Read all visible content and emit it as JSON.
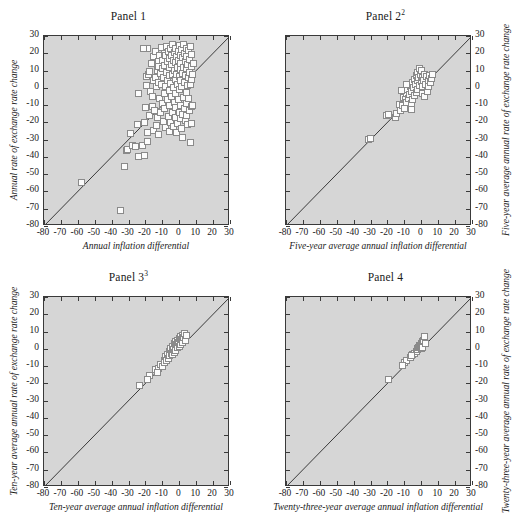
{
  "figure": {
    "background_color": "#ffffff",
    "plot_background_color": "#d6d6d6",
    "axis_color": "#3a3a3a",
    "marker_face_color": "#fcfcfc",
    "marker_edge_color": "#8a8a8a",
    "panel_count": 4
  },
  "chart_data": [
    {
      "type": "scatter",
      "title": "Panel 1",
      "title_superscript": "",
      "xlabel": "Annual inflation differential",
      "ylabel": "Annual rate of exchange rate change",
      "yaxis_side": "left",
      "xlim": [
        -80,
        30
      ],
      "ylim": [
        -80,
        30
      ],
      "xticks": [
        -80,
        -70,
        -60,
        -50,
        -40,
        -30,
        -20,
        -10,
        0,
        10,
        20,
        30
      ],
      "yticks": [
        -80,
        -70,
        -60,
        -50,
        -40,
        -30,
        -20,
        -10,
        0,
        10,
        20,
        30
      ],
      "xtick_labels": [
        "-80",
        "-70",
        "-60",
        "-50",
        "-40",
        "-30",
        "-20",
        "-10",
        "0",
        "10",
        "20",
        "30"
      ],
      "ytick_labels": [
        "-80",
        "-70",
        "-60",
        "-50",
        "-40",
        "-30",
        "-20",
        "-10",
        "0",
        "10",
        "20",
        "30"
      ],
      "grid": false,
      "legend": null,
      "reference_line": {
        "type": "45-degree",
        "from": [
          -80,
          -80
        ],
        "to": [
          30,
          30
        ]
      },
      "points": [
        [
          -58,
          -55
        ],
        [
          -35,
          -71
        ],
        [
          -32.5,
          -45.5
        ],
        [
          -31.5,
          -36.5
        ],
        [
          -30.5,
          -35.5
        ],
        [
          -29,
          -26.5
        ],
        [
          -27.5,
          -33.5
        ],
        [
          -26,
          -34
        ],
        [
          -25,
          -21
        ],
        [
          -24,
          -39.5
        ],
        [
          -21.5,
          -33.5
        ],
        [
          -20.5,
          -39
        ],
        [
          -20.5,
          -20
        ],
        [
          -20,
          -11.5
        ],
        [
          -19.5,
          6.5
        ],
        [
          -19.5,
          1.5
        ],
        [
          -18.5,
          -26
        ],
        [
          -18.5,
          -31
        ],
        [
          -18,
          7.5
        ],
        [
          -17.5,
          -16
        ],
        [
          -17.5,
          9.5
        ],
        [
          -17,
          -2
        ],
        [
          -16.5,
          14
        ],
        [
          -16,
          -11
        ],
        [
          -15.5,
          -24.5
        ],
        [
          -15.5,
          4.5
        ],
        [
          -15,
          18
        ],
        [
          -14.5,
          -13
        ],
        [
          -14,
          6
        ],
        [
          -14,
          21
        ],
        [
          -13.5,
          -22
        ],
        [
          -13.5,
          0.5
        ],
        [
          -13,
          10
        ],
        [
          -13,
          -17
        ],
        [
          -12.5,
          15
        ],
        [
          -12.5,
          -27
        ],
        [
          -12,
          3
        ],
        [
          -12,
          12.5
        ],
        [
          -11.5,
          -6
        ],
        [
          -11.5,
          19
        ],
        [
          -11,
          8.5
        ],
        [
          -11,
          -14.5
        ],
        [
          -10.5,
          2
        ],
        [
          -10.5,
          23.5
        ],
        [
          -10,
          -9
        ],
        [
          -10,
          16
        ],
        [
          -10,
          11
        ],
        [
          -9.5,
          -19.5
        ],
        [
          -9.5,
          6
        ],
        [
          -9,
          20
        ],
        [
          -9,
          -3.5
        ],
        [
          -8.5,
          13
        ],
        [
          -8.5,
          -12
        ],
        [
          -8,
          1
        ],
        [
          -8,
          18.5
        ],
        [
          -8,
          -23
        ],
        [
          -7.5,
          9
        ],
        [
          -7.5,
          24
        ],
        [
          -7,
          -6.5
        ],
        [
          -7,
          15
        ],
        [
          -7,
          4
        ],
        [
          -6.5,
          -16.5
        ],
        [
          -6.5,
          21
        ],
        [
          -6,
          11.5
        ],
        [
          -6,
          -1.5
        ],
        [
          -6,
          -25
        ],
        [
          -5.5,
          7
        ],
        [
          -5.5,
          17
        ],
        [
          -5.5,
          -10.5
        ],
        [
          -5,
          2.5
        ],
        [
          -5,
          22.5
        ],
        [
          -5,
          -20
        ],
        [
          -4.5,
          13.5
        ],
        [
          -4.5,
          -5
        ],
        [
          -4.5,
          19
        ],
        [
          -4,
          8
        ],
        [
          -4,
          -14
        ],
        [
          -4,
          25
        ],
        [
          -3.5,
          0
        ],
        [
          -3.5,
          16
        ],
        [
          -3.5,
          -22.5
        ],
        [
          -3,
          10
        ],
        [
          -3,
          -8.5
        ],
        [
          -3,
          20.5
        ],
        [
          -2.5,
          5
        ],
        [
          -2.5,
          -17
        ],
        [
          -2.5,
          14.5
        ],
        [
          -2,
          23
        ],
        [
          -2,
          -3
        ],
        [
          -2,
          -11.5
        ],
        [
          -1.5,
          18
        ],
        [
          -1.5,
          8
        ],
        [
          -1.5,
          -26
        ],
        [
          -1,
          12
        ],
        [
          -1,
          -20.5
        ],
        [
          -1,
          2
        ],
        [
          -0.5,
          21
        ],
        [
          -0.5,
          -7
        ],
        [
          -0.5,
          16
        ],
        [
          0,
          -14
        ],
        [
          0,
          6.5
        ],
        [
          0,
          24.5
        ],
        [
          0,
          -1
        ],
        [
          0.5,
          10.5
        ],
        [
          0.5,
          -18
        ],
        [
          0.5,
          19
        ],
        [
          1,
          4
        ],
        [
          1,
          -10
        ],
        [
          1,
          14
        ],
        [
          1.5,
          22
        ],
        [
          1.5,
          -23.5
        ],
        [
          1.5,
          0.5
        ],
        [
          2,
          8.5
        ],
        [
          2,
          -15.5
        ],
        [
          2,
          17.5
        ],
        [
          2.5,
          -5.5
        ],
        [
          2.5,
          12
        ],
        [
          2.5,
          25
        ],
        [
          3,
          -12
        ],
        [
          3,
          3
        ],
        [
          3,
          20
        ],
        [
          3.5,
          -19
        ],
        [
          3.5,
          7
        ],
        [
          3.5,
          15
        ],
        [
          4,
          -2.5
        ],
        [
          4,
          23
        ],
        [
          4,
          -9
        ],
        [
          4.5,
          11
        ],
        [
          4.5,
          -16
        ],
        [
          4.5,
          18
        ],
        [
          5,
          1.5
        ],
        [
          5,
          -21
        ],
        [
          5,
          13.5
        ],
        [
          5.5,
          6
        ],
        [
          5.5,
          -6
        ],
        [
          5.5,
          21.5
        ],
        [
          6,
          -13
        ],
        [
          6,
          9
        ],
        [
          6,
          16.5
        ],
        [
          6.5,
          -31.5
        ],
        [
          6.5,
          2
        ],
        [
          6.5,
          24
        ],
        [
          7,
          -11
        ],
        [
          7,
          12.5
        ],
        [
          7.5,
          -20.5
        ],
        [
          7.5,
          5
        ],
        [
          7.5,
          19.5
        ],
        [
          8,
          -10.5
        ],
        [
          8,
          8
        ],
        [
          8.5,
          14
        ],
        [
          -19,
          23
        ],
        [
          -24,
          -3.5
        ],
        [
          -21,
          23
        ],
        [
          2,
          -28.5
        ],
        [
          -16,
          -5
        ]
      ]
    },
    {
      "type": "scatter",
      "title": "Panel 2",
      "title_superscript": "2",
      "xlabel": "Five-year average annual inflation differential",
      "ylabel": "Five-year average annual rate of exchange rate change",
      "yaxis_side": "right",
      "xlim": [
        -80,
        30
      ],
      "ylim": [
        -80,
        30
      ],
      "xticks": [
        -80,
        -70,
        -60,
        -50,
        -40,
        -30,
        -20,
        -10,
        0,
        10,
        20,
        30
      ],
      "yticks": [
        -80,
        -70,
        -60,
        -50,
        -40,
        -30,
        -20,
        -10,
        0,
        10,
        20,
        30
      ],
      "xtick_labels": [
        "-80",
        "-70",
        "-60",
        "-50",
        "-40",
        "-30",
        "-20",
        "-10",
        "0",
        "10",
        "20",
        "30"
      ],
      "ytick_labels": [
        "-80",
        "-70",
        "-60",
        "-50",
        "-40",
        "-30",
        "-20",
        "-10",
        "0",
        "10",
        "20",
        "30"
      ],
      "grid": false,
      "legend": null,
      "reference_line": {
        "type": "45-degree",
        "from": [
          -80,
          -80
        ],
        "to": [
          30,
          30
        ]
      },
      "points": [
        [
          -31,
          -30
        ],
        [
          -30,
          -29.5
        ],
        [
          -20.5,
          -16
        ],
        [
          -19.5,
          -15.5
        ],
        [
          -15.5,
          -17
        ],
        [
          -14.5,
          -15
        ],
        [
          -13,
          -9.5
        ],
        [
          -12,
          -13
        ],
        [
          -11,
          -10
        ],
        [
          -10.5,
          -5.5
        ],
        [
          -10,
          -12
        ],
        [
          -9.5,
          -7
        ],
        [
          -9,
          -3.5
        ],
        [
          -8.5,
          -8.5
        ],
        [
          -8,
          -1
        ],
        [
          -7.5,
          -6
        ],
        [
          -7,
          -4
        ],
        [
          -6.5,
          1
        ],
        [
          -6,
          -9
        ],
        [
          -5.5,
          -2
        ],
        [
          -5,
          3
        ],
        [
          -5,
          -6.5
        ],
        [
          -4.5,
          0
        ],
        [
          -4,
          5
        ],
        [
          -4,
          -4.5
        ],
        [
          -3.5,
          2
        ],
        [
          -3,
          7
        ],
        [
          -3,
          -2.5
        ],
        [
          -2.5,
          4
        ],
        [
          -2,
          9
        ],
        [
          -2,
          -1
        ],
        [
          -1.5,
          6
        ],
        [
          -1,
          11
        ],
        [
          -1,
          1.5
        ],
        [
          -0.5,
          8
        ],
        [
          0,
          3.5
        ],
        [
          0,
          10
        ],
        [
          0.5,
          0.5
        ],
        [
          1,
          6
        ],
        [
          1,
          -3
        ],
        [
          1.5,
          4
        ],
        [
          2,
          8
        ],
        [
          2,
          -5
        ],
        [
          2.5,
          2
        ],
        [
          3,
          6.5
        ],
        [
          3.5,
          -2
        ],
        [
          4,
          4.5
        ],
        [
          4.5,
          1
        ],
        [
          5,
          7
        ],
        [
          5.5,
          3
        ],
        [
          6,
          5.5
        ],
        [
          6.5,
          8
        ],
        [
          -9,
          2
        ],
        [
          -11.5,
          -1.5
        ],
        [
          -6,
          -12.5
        ]
      ]
    },
    {
      "type": "scatter",
      "title": "Panel 3",
      "title_superscript": "3",
      "xlabel": "Ten-year average annual inflation differential",
      "ylabel": "Ten-year average annual rate of exchange rate change",
      "yaxis_side": "left",
      "xlim": [
        -80,
        30
      ],
      "ylim": [
        -80,
        30
      ],
      "xticks": [
        -80,
        -70,
        -60,
        -50,
        -40,
        -30,
        -20,
        -10,
        0,
        10,
        20,
        30
      ],
      "yticks": [
        -80,
        -70,
        -60,
        -50,
        -40,
        -30,
        -20,
        -10,
        0,
        10,
        20,
        30
      ],
      "xtick_labels": [
        "-80",
        "-70",
        "-60",
        "-50",
        "-40",
        "-30",
        "-20",
        "-10",
        "0",
        "10",
        "20",
        "30"
      ],
      "ytick_labels": [
        "-80",
        "-70",
        "-60",
        "-50",
        "-40",
        "-30",
        "-20",
        "-10",
        "0",
        "10",
        "20",
        "30"
      ],
      "grid": false,
      "legend": null,
      "reference_line": {
        "type": "45-degree",
        "from": [
          -80,
          -80
        ],
        "to": [
          30,
          30
        ]
      },
      "points": [
        [
          -23.5,
          -21.5
        ],
        [
          -17.5,
          -15.5
        ],
        [
          -14,
          -12
        ],
        [
          -12.5,
          -11.5
        ],
        [
          -11,
          -9
        ],
        [
          -10,
          -10.5
        ],
        [
          -9,
          -6.5
        ],
        [
          -8.5,
          -8
        ],
        [
          -8,
          -4.5
        ],
        [
          -7.5,
          -7
        ],
        [
          -7,
          -3
        ],
        [
          -6.5,
          -5.5
        ],
        [
          -6,
          -1.5
        ],
        [
          -5.5,
          -4
        ],
        [
          -5,
          0
        ],
        [
          -4.5,
          -2.5
        ],
        [
          -4,
          1.5
        ],
        [
          -4,
          -3.5
        ],
        [
          -3.5,
          -0.5
        ],
        [
          -3,
          3
        ],
        [
          -3,
          -2
        ],
        [
          -2.5,
          1
        ],
        [
          -2,
          4
        ],
        [
          -2,
          -1
        ],
        [
          -1.5,
          2.5
        ],
        [
          -1,
          5
        ],
        [
          -1,
          0.5
        ],
        [
          -0.5,
          3.5
        ],
        [
          0,
          6
        ],
        [
          0,
          1.5
        ],
        [
          0.5,
          4.5
        ],
        [
          1,
          7
        ],
        [
          1,
          2.5
        ],
        [
          1.5,
          5.5
        ],
        [
          2,
          8
        ],
        [
          2,
          3.5
        ],
        [
          2.5,
          6.5
        ],
        [
          3,
          9
        ],
        [
          3.5,
          5
        ],
        [
          4,
          7.5
        ],
        [
          -13,
          -13.5
        ],
        [
          -19,
          -18
        ]
      ]
    },
    {
      "type": "scatter",
      "title": "Panel 4",
      "title_superscript": "",
      "xlabel": "Twenty-three-year average annual inflation differential",
      "ylabel": "Twenty-three-year average annual rate of exchange rate change",
      "yaxis_side": "right",
      "xlim": [
        -80,
        30
      ],
      "ylim": [
        -80,
        30
      ],
      "xticks": [
        -80,
        -70,
        -60,
        -50,
        -40,
        -30,
        -20,
        -10,
        0,
        10,
        20,
        30
      ],
      "yticks": [
        -80,
        -70,
        -60,
        -50,
        -40,
        -30,
        -20,
        -10,
        0,
        10,
        20,
        30
      ],
      "xtick_labels": [
        "-80",
        "-70",
        "-60",
        "-50",
        "-40",
        "-30",
        "-20",
        "-10",
        "0",
        "10",
        "20",
        "30"
      ],
      "ytick_labels": [
        "-80",
        "-70",
        "-60",
        "-50",
        "-40",
        "-30",
        "-20",
        "-10",
        "0",
        "10",
        "20",
        "30"
      ],
      "grid": false,
      "legend": null,
      "reference_line": {
        "type": "45-degree",
        "from": [
          -80,
          -80
        ],
        "to": [
          30,
          30
        ]
      },
      "points": [
        [
          -19.5,
          -18
        ],
        [
          -10,
          -8
        ],
        [
          -8.5,
          -6.5
        ],
        [
          -6.5,
          -5
        ],
        [
          -5,
          -3.5
        ],
        [
          -4,
          -2.5
        ],
        [
          -3,
          -1.5
        ],
        [
          -2.5,
          0
        ],
        [
          -2,
          -0.5
        ],
        [
          -1.5,
          1
        ],
        [
          -1,
          0.5
        ],
        [
          -1,
          2
        ],
        [
          -0.5,
          1.5
        ],
        [
          0,
          3
        ],
        [
          0,
          0
        ],
        [
          0.5,
          2.5
        ],
        [
          1,
          4
        ],
        [
          1,
          1
        ],
        [
          1.5,
          5
        ],
        [
          2,
          7
        ],
        [
          2.5,
          3
        ],
        [
          -6,
          -4
        ],
        [
          -11,
          -9.5
        ]
      ]
    }
  ]
}
